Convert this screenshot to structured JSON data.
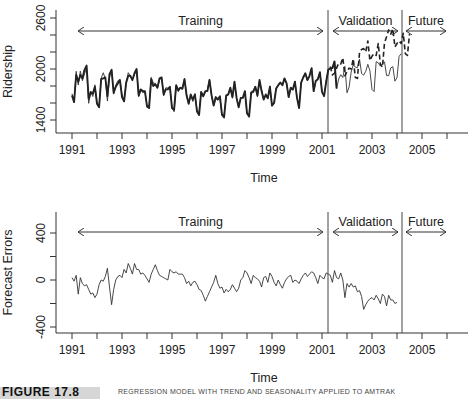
{
  "chart_data": [
    {
      "type": "line",
      "title": "",
      "xlabel": "Time",
      "ylabel": "Ridership",
      "xlim": [
        1990.75,
        2006.8
      ],
      "ylim": [
        1300,
        2650
      ],
      "x_ticks": [
        1991,
        1992,
        1993,
        1994,
        1995,
        1996,
        1997,
        1998,
        1999,
        2000,
        2001,
        2002,
        2003,
        2004,
        2005,
        2006
      ],
      "x_tick_labels": [
        "1991",
        "",
        "1993",
        "",
        "1995",
        "",
        "1997",
        "",
        "1999",
        "",
        "2001",
        "",
        "2003",
        "",
        "2005",
        ""
      ],
      "y_ticks": [
        1400,
        1600,
        1800,
        2000,
        2200,
        2400,
        2600
      ],
      "y_tick_labels": [
        "1400",
        "",
        "",
        "2000",
        "",
        "",
        "2600"
      ],
      "grid": false,
      "x_start": 1991.0,
      "x_step": 0.0833333,
      "series": [
        {
          "name": "Actual ridership",
          "style": "thin-solid",
          "values": [
            1709,
            1621,
            1973,
            1812,
            1975,
            1862,
            1940,
            2013,
            1596,
            1725,
            1676,
            1814,
            1615,
            1557,
            1891,
            1956,
            1885,
            1623,
            1903,
            1997,
            1704,
            1810,
            1862,
            1875,
            1705,
            1619,
            1837,
            1957,
            1917,
            1882,
            1933,
            1996,
            1673,
            1753,
            1720,
            1734,
            1563,
            1574,
            1903,
            1834,
            1831,
            1776,
            1868,
            1907,
            1686,
            1779,
            1776,
            1783,
            1548,
            1497,
            1798,
            1733,
            1772,
            1761,
            1890,
            1691,
            1590,
            1693,
            1618,
            1709,
            1520,
            1481,
            1731,
            1669,
            1731,
            1756,
            1880,
            1684,
            1569,
            1654,
            1637,
            1655,
            1458,
            1463,
            1666,
            1710,
            1775,
            1656,
            1854,
            1656,
            1552,
            1665,
            1658,
            1739,
            1468,
            1461,
            1737,
            1742,
            1800,
            1670,
            1862,
            1751,
            1639,
            1688,
            1645,
            1803,
            1563,
            1614,
            1775,
            1813,
            1843,
            1810,
            1890,
            1834,
            1664,
            1781,
            1750,
            1857,
            1673,
            1540,
            1850,
            1912,
            1949,
            1862,
            1912,
            2012,
            1731,
            1857,
            1885,
            1969,
            1733,
            1683,
            1856,
            1990,
            2009,
            2012,
            2093,
            1770,
            1882,
            1933,
            1900,
            2031,
            1720,
            1787,
            1963,
            2050,
            2022,
            2016,
            2117,
            1947,
            1928,
            1973,
            2055,
            1981,
            1759,
            1734,
            2086,
            2073,
            2033,
            2059,
            2084,
            1922,
            1922,
            2012,
            2028,
            1857,
            1898,
            2148,
            2181
          ]
        },
        {
          "name": "Fitted / forecast (training)",
          "style": "thick-solid",
          "values": [
            1690,
            1610,
            1930,
            1850,
            1930,
            1890,
            1990,
            2040,
            1650,
            1730,
            1710,
            1790,
            1590,
            1550,
            1880,
            1890,
            1900,
            1680,
            1940,
            1990,
            1720,
            1790,
            1830,
            1870,
            1670,
            1620,
            1840,
            1920,
            1920,
            1870,
            1950,
            2000,
            1690,
            1760,
            1740,
            1740,
            1560,
            1540,
            1880,
            1800,
            1820,
            1780,
            1890,
            1900,
            1700,
            1760,
            1760,
            1790,
            1540,
            1520,
            1810,
            1750,
            1780,
            1770,
            1880,
            1690,
            1590,
            1700,
            1640,
            1700,
            1500,
            1460,
            1730,
            1680,
            1740,
            1740,
            1870,
            1690,
            1570,
            1670,
            1640,
            1680,
            1460,
            1430,
            1690,
            1700,
            1780,
            1670,
            1850,
            1660,
            1550,
            1660,
            1660,
            1740,
            1480,
            1440,
            1720,
            1730,
            1790,
            1690,
            1870,
            1740,
            1640,
            1700,
            1660,
            1790,
            1570,
            1600,
            1770,
            1810,
            1840,
            1810,
            1890,
            1830,
            1670,
            1780,
            1760,
            1850,
            1660,
            1540,
            1840,
            1900,
            1950,
            1870,
            1920,
            2010,
            1740,
            1860,
            1880,
            1960,
            1730,
            1680,
            1850,
            1990,
            2010,
            2010,
            2090,
            1770
          ]
        },
        {
          "name": "Forecast (validation)",
          "style": "dashed",
          "x_start_index": 124,
          "values": [
            2030,
            1930,
            1950,
            2010,
            2070,
            2060,
            2130,
            1920,
            1970,
            2010,
            2000,
            2120,
            1900,
            1890,
            2190,
            2230,
            2240,
            2200,
            2330,
            2100,
            2150,
            2180,
            2160,
            2300,
            2060,
            2020,
            2310,
            2380,
            2460,
            2410,
            2470,
            2260,
            2300,
            2330,
            2300,
            2420,
            2180,
            2160,
            2410
          ]
        }
      ],
      "annotations": [
        {
          "text": "Training",
          "arrow_from": 1991.0,
          "arrow_to": 2001.1
        },
        {
          "text": "Validation",
          "arrow_from": 2001.4,
          "arrow_to": 2004.1
        },
        {
          "text": "Future",
          "arrow_from": 2004.4,
          "arrow_to": 2006.0
        }
      ],
      "dividers": [
        2001.25,
        2004.25
      ]
    },
    {
      "type": "line",
      "title": "",
      "xlabel": "Time",
      "ylabel": "Forecast Errors",
      "xlim": [
        1990.75,
        2006.8
      ],
      "ylim": [
        -420,
        620
      ],
      "x_ticks": [
        1991,
        1992,
        1993,
        1994,
        1995,
        1996,
        1997,
        1998,
        1999,
        2000,
        2001,
        2002,
        2003,
        2004,
        2005,
        2006
      ],
      "x_tick_labels": [
        "1991",
        "",
        "1993",
        "",
        "1995",
        "",
        "1997",
        "",
        "1999",
        "",
        "2001",
        "",
        "2003",
        "",
        "2005",
        ""
      ],
      "y_ticks": [
        -400,
        -200,
        0,
        200,
        400
      ],
      "y_tick_labels": [
        "-400",
        "",
        "0",
        "",
        "400"
      ],
      "grid": false,
      "x_start": 1991.0,
      "x_step": 0.0833333,
      "series": [
        {
          "name": "Forecast errors",
          "style": "thin-solid",
          "values": [
            20,
            -10,
            40,
            -120,
            20,
            -30,
            -50,
            -40,
            -80,
            -120,
            -110,
            -150,
            -120,
            -40,
            0,
            -10,
            30,
            100,
            -60,
            -210,
            -80,
            0,
            30,
            40,
            20,
            90,
            60,
            140,
            100,
            50,
            140,
            90,
            90,
            50,
            60,
            40,
            10,
            -20,
            50,
            90,
            130,
            80,
            40,
            30,
            20,
            10,
            0,
            90,
            70,
            60,
            70,
            50,
            50,
            50,
            20,
            -30,
            -10,
            -50,
            -20,
            -10,
            -40,
            -80,
            -90,
            -130,
            -180,
            -140,
            -100,
            -60,
            -20,
            40,
            -30,
            -70,
            -60,
            -110,
            -80,
            -100,
            -80,
            -40,
            -70,
            -100,
            -70,
            0,
            20,
            80,
            60,
            20,
            -30,
            40,
            20,
            10,
            -10,
            -60,
            20,
            30,
            -20,
            60,
            30,
            -20,
            -50,
            0,
            -40,
            -70,
            -20,
            10,
            30,
            40,
            -20,
            0,
            -10,
            -30,
            10,
            40,
            60,
            30,
            50,
            70,
            60,
            20,
            -30,
            40,
            20,
            10,
            60,
            50,
            40,
            -20,
            80,
            20,
            10,
            60,
            0,
            -150,
            -30,
            -60,
            -30,
            -60,
            -50,
            -100,
            -90,
            -140,
            -250,
            -210,
            -180,
            -160,
            -150,
            -170,
            -130,
            -160,
            -200,
            -120,
            -140,
            -220,
            -130,
            -170,
            -170,
            -200,
            -190
          ]
        }
      ],
      "annotations": [
        {
          "text": "Training",
          "arrow_from": 1991.0,
          "arrow_to": 2001.1
        },
        {
          "text": "Validation",
          "arrow_from": 2001.4,
          "arrow_to": 2004.1
        },
        {
          "text": "Future",
          "arrow_from": 2004.4,
          "arrow_to": 2006.0
        }
      ],
      "dividers": [
        2001.25,
        2004.25
      ]
    }
  ],
  "caption": {
    "figure_label": "FIGURE 17.8",
    "text": "REGRESSION MODEL WITH TREND AND SEASONALITY APPLIED TO AMTRAK"
  }
}
